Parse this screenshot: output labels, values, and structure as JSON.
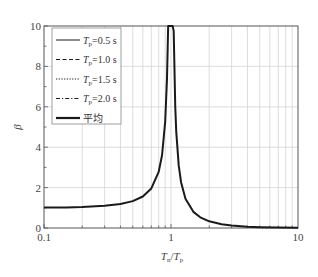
{
  "chart_data": {
    "type": "line",
    "title": "",
    "xlabel": "Tn/Tp",
    "xlabel_parts": {
      "main1": "T",
      "sub1": "n",
      "sep": "/",
      "main2": "T",
      "sub2": "p"
    },
    "ylabel": "β",
    "xscale": "log",
    "xlim": [
      0.1,
      10
    ],
    "ylim": [
      0,
      10
    ],
    "x_ticks": [
      {
        "value": 0.1,
        "label": "0.1"
      },
      {
        "value": 1,
        "label": "1"
      },
      {
        "value": 10,
        "label": "10"
      }
    ],
    "y_ticks": [
      {
        "value": 0,
        "label": "0"
      },
      {
        "value": 2,
        "label": "2"
      },
      {
        "value": 4,
        "label": "4"
      },
      {
        "value": 6,
        "label": "6"
      },
      {
        "value": 8,
        "label": "8"
      },
      {
        "value": 10,
        "label": "10"
      }
    ],
    "y_minor_ticks": [
      1,
      3,
      5,
      7,
      9
    ],
    "grid": true,
    "legend_position": "upper left",
    "legend": [
      {
        "label": "Tp=0.5 s",
        "var": "T",
        "sub": "p",
        "value": "=0.5 s",
        "style": "solid",
        "width": 1
      },
      {
        "label": "Tp=1.0 s",
        "var": "T",
        "sub": "p",
        "value": "=1.0 s",
        "style": "dashed",
        "width": 1
      },
      {
        "label": "Tp=1.5 s",
        "var": "T",
        "sub": "p",
        "value": "=1.5 s",
        "style": "dotted",
        "width": 1
      },
      {
        "label": "Tp=2.0 s",
        "var": "T",
        "sub": "p",
        "value": "=2.0 s",
        "style": "dashdot",
        "width": 1
      },
      {
        "label": "平均",
        "var": "",
        "sub": "",
        "value": "平均",
        "style": "solid",
        "width": 2.2
      }
    ],
    "series": [
      {
        "name": "平均",
        "x": [
          0.1,
          0.15,
          0.2,
          0.3,
          0.4,
          0.5,
          0.6,
          0.7,
          0.8,
          0.85,
          0.9,
          0.93,
          0.95,
          0.97,
          1.0,
          1.03,
          1.05,
          1.08,
          1.1,
          1.15,
          1.2,
          1.3,
          1.5,
          1.7,
          2.0,
          2.5,
          3.0,
          4.0,
          5.0,
          7.0,
          10.0
        ],
        "y": [
          1.01,
          1.02,
          1.04,
          1.1,
          1.19,
          1.33,
          1.56,
          1.96,
          2.78,
          3.6,
          5.26,
          7.4,
          10.0,
          10.0,
          10.0,
          10.0,
          9.76,
          6.01,
          4.76,
          3.1,
          2.27,
          1.45,
          0.8,
          0.53,
          0.33,
          0.19,
          0.125,
          0.067,
          0.042,
          0.021,
          0.01
        ]
      }
    ],
    "colors": {
      "line": "#1a1a1a",
      "grid": "#d4d4d4",
      "axis": "#555555"
    }
  }
}
